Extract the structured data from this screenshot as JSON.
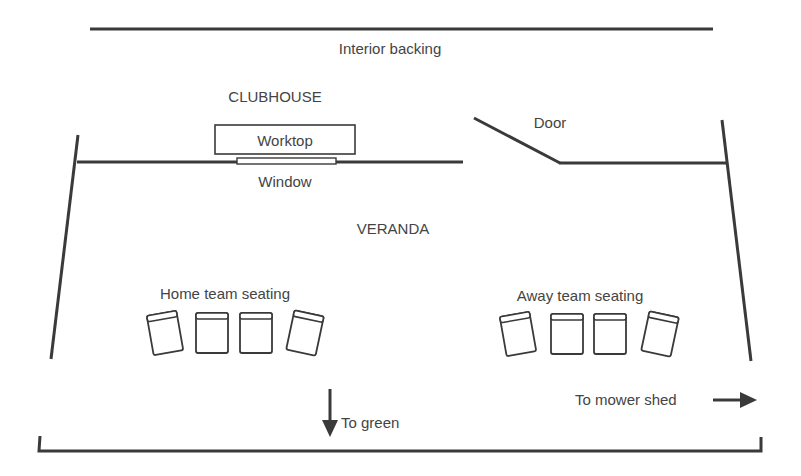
{
  "diagram": {
    "labels": {
      "interior_backing": "Interior backing",
      "clubhouse": "CLUBHOUSE",
      "worktop": "Worktop",
      "window": "Window",
      "door": "Door",
      "veranda": "VERANDA",
      "home_seating": "Home team seating",
      "away_seating": "Away team seating",
      "to_green": "To green",
      "to_mower_shed": "To mower shed"
    },
    "seating": {
      "home_chairs": 4,
      "away_chairs": 4
    },
    "colors": {
      "line": "#3a3a3a",
      "text": "#444444",
      "background": "#ffffff"
    }
  }
}
